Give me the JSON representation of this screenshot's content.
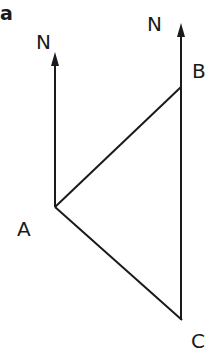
{
  "figure": {
    "part_label": "a",
    "north_left": "N",
    "north_right": "N",
    "points": {
      "A": {
        "label": "A",
        "x": 55,
        "y": 207
      },
      "B": {
        "label": "B",
        "x": 181,
        "y": 87
      },
      "C": {
        "label": "C",
        "x": 182,
        "y": 320
      }
    },
    "colors": {
      "line": "#1a1a1a",
      "background": "#ffffff"
    }
  }
}
